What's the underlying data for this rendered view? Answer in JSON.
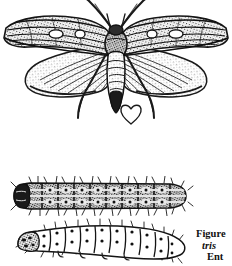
{
  "page": {
    "kind": "scanned-figure-plate",
    "background_color": "#ffffff",
    "ink_color": "#111111",
    "width": 232,
    "height": 266
  },
  "figures": [
    {
      "id": "moth",
      "name": "adult-moth-specimen",
      "description": "Adult moth, dorsal view, wings spread, engraved halftone line illustration",
      "features": [
        "left-forewing",
        "right-forewing",
        "left-hindwing",
        "right-hindwing",
        "thorax",
        "abdomen",
        "antenna-left",
        "antenna-right",
        "foreleg-left",
        "foreleg-right",
        "heart-shaped-mark"
      ]
    },
    {
      "id": "larva-dark",
      "name": "larva-dark-form",
      "description": "Caterpillar larva, dark pigmented form, lateral view with bristles and segment markings"
    },
    {
      "id": "larva-light",
      "name": "larva-light-form",
      "description": "Caterpillar larva, pale outline form, lateral view with dark spiracular spots and bristles"
    }
  ],
  "caption": {
    "name": "figure-caption",
    "clipped": true,
    "lines": [
      {
        "text": "Figure",
        "style": "bold"
      },
      {
        "text": "tris",
        "style": "bold-italic"
      },
      {
        "text": "Ent",
        "style": "bold"
      }
    ]
  }
}
